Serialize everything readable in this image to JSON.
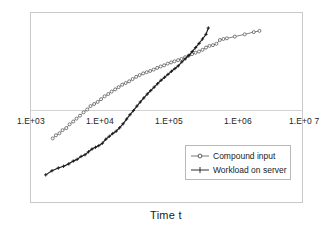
{
  "chart_data": {
    "type": "line",
    "title": "",
    "xlabel": "Time  t",
    "ylabel": "",
    "xscale": "log",
    "yscale": "linear",
    "grid": false,
    "legend_position": "lower-right",
    "xlim": [
      1000,
      10000000
    ],
    "xticks": [
      1000,
      10000,
      100000,
      1000000,
      10000000
    ],
    "xticklabels": [
      "1.E+03",
      "1.E+04",
      "1.E+05",
      "1.E+06",
      "1.E+0 7"
    ],
    "series": [
      {
        "name": "Compound input",
        "marker": "open-circle",
        "color": "#6b6b6b",
        "points": [
          [
            2150,
            0.3
          ],
          [
            2400,
            0.318
          ],
          [
            2700,
            0.33
          ],
          [
            3000,
            0.348
          ],
          [
            3400,
            0.36
          ],
          [
            3800,
            0.382
          ],
          [
            4300,
            0.398
          ],
          [
            4800,
            0.415
          ],
          [
            5400,
            0.432
          ],
          [
            6100,
            0.452
          ],
          [
            6900,
            0.468
          ],
          [
            7700,
            0.488
          ],
          [
            8700,
            0.5
          ],
          [
            9800,
            0.512
          ],
          [
            11000,
            0.528
          ],
          [
            12400,
            0.545
          ],
          [
            14000,
            0.558
          ],
          [
            15700,
            0.572
          ],
          [
            17700,
            0.585
          ],
          [
            19900,
            0.598
          ],
          [
            22400,
            0.612
          ],
          [
            25200,
            0.622
          ],
          [
            28400,
            0.632
          ],
          [
            31900,
            0.645
          ],
          [
            35900,
            0.658
          ],
          [
            40400,
            0.668
          ],
          [
            45500,
            0.678
          ],
          [
            51200,
            0.685
          ],
          [
            57600,
            0.692
          ],
          [
            64800,
            0.7
          ],
          [
            72900,
            0.71
          ],
          [
            82000,
            0.718
          ],
          [
            92200,
            0.725
          ],
          [
            104000,
            0.735
          ],
          [
            117000,
            0.742
          ],
          [
            131000,
            0.748
          ],
          [
            148000,
            0.755
          ],
          [
            166000,
            0.762
          ],
          [
            187000,
            0.772
          ],
          [
            210000,
            0.78
          ],
          [
            237000,
            0.79
          ],
          [
            266000,
            0.798
          ],
          [
            299000,
            0.805
          ],
          [
            337000,
            0.815
          ],
          [
            379000,
            0.828
          ],
          [
            426000,
            0.838
          ],
          [
            479000,
            0.842
          ],
          [
            539000,
            0.85
          ],
          [
            606000,
            0.872
          ],
          [
            682000,
            0.878
          ],
          [
            767000,
            0.882
          ],
          [
            1000000,
            0.892
          ],
          [
            1400000,
            0.905
          ],
          [
            1900000,
            0.918
          ],
          [
            2300000,
            0.925
          ]
        ]
      },
      {
        "name": "Workload on server",
        "marker": "plus",
        "color": "#1a1a1a",
        "points": [
          [
            1700,
            0.088
          ],
          [
            2100,
            0.112
          ],
          [
            2600,
            0.128
          ],
          [
            3100,
            0.138
          ],
          [
            3700,
            0.152
          ],
          [
            4300,
            0.168
          ],
          [
            4900,
            0.178
          ],
          [
            5600,
            0.195
          ],
          [
            6400,
            0.205
          ],
          [
            7200,
            0.222
          ],
          [
            8100,
            0.238
          ],
          [
            9100,
            0.248
          ],
          [
            10200,
            0.258
          ],
          [
            11500,
            0.272
          ],
          [
            12900,
            0.295
          ],
          [
            14500,
            0.312
          ],
          [
            16300,
            0.328
          ],
          [
            18300,
            0.342
          ],
          [
            20600,
            0.362
          ],
          [
            23100,
            0.385
          ],
          [
            26000,
            0.412
          ],
          [
            29200,
            0.438
          ],
          [
            32800,
            0.462
          ],
          [
            36900,
            0.488
          ],
          [
            41400,
            0.512
          ],
          [
            46500,
            0.535
          ],
          [
            52300,
            0.558
          ],
          [
            58700,
            0.578
          ],
          [
            66000,
            0.598
          ],
          [
            74100,
            0.618
          ],
          [
            83300,
            0.638
          ],
          [
            93600,
            0.655
          ],
          [
            105000,
            0.672
          ],
          [
            118000,
            0.69
          ],
          [
            133000,
            0.706
          ],
          [
            149000,
            0.722
          ],
          [
            168000,
            0.745
          ],
          [
            188000,
            0.762
          ],
          [
            212000,
            0.782
          ],
          [
            238000,
            0.805
          ],
          [
            267000,
            0.828
          ],
          [
            300000,
            0.852
          ],
          [
            337000,
            0.878
          ],
          [
            379000,
            0.905
          ],
          [
            410000,
            0.942
          ]
        ]
      }
    ]
  },
  "axis": {
    "title": "Time  t",
    "ticks": [
      {
        "label": "1.E+03"
      },
      {
        "label": "1.E+04"
      },
      {
        "label": "1.E+05"
      },
      {
        "label": "1.E+06"
      },
      {
        "label": "1.E+0 7"
      }
    ]
  },
  "legend": {
    "entries": [
      {
        "label": "Compound input"
      },
      {
        "label": "Workload on server"
      }
    ]
  }
}
